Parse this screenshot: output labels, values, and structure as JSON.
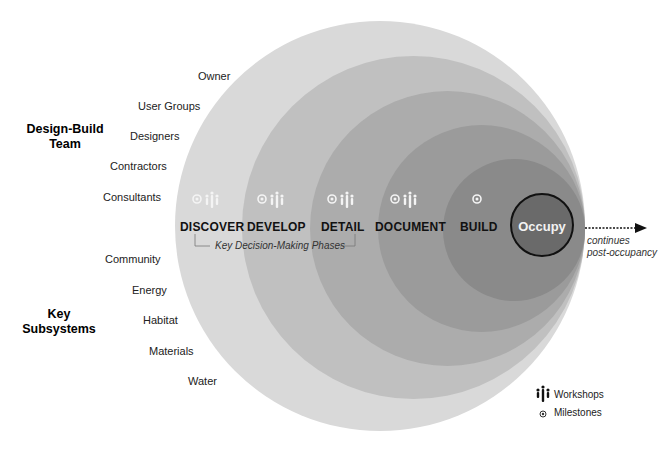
{
  "colors": {
    "ring1": "#d9d9d9",
    "ring2": "#c0c0c0",
    "ring3": "#acacac",
    "ring4": "#9b9b9b",
    "ring5": "#8a8a8a",
    "occupy_fill": "#6a6a6a",
    "occupy_stroke": "#111111",
    "icon_white": "#f4f4f4",
    "text": "#222222"
  },
  "design_build_team": {
    "heading_line1": "Design-Build",
    "heading_line2": "Team",
    "members": [
      "Owner",
      "User Groups",
      "Designers",
      "Contractors",
      "Consultants"
    ]
  },
  "key_subsystems": {
    "heading_line1": "Key",
    "heading_line2": "Subsystems",
    "items": [
      "Community",
      "Energy",
      "Habitat",
      "Materials",
      "Water"
    ]
  },
  "phases": [
    {
      "label": "DISCOVER",
      "milestone": true,
      "workshop": true
    },
    {
      "label": "DEVELOP",
      "milestone": true,
      "workshop": true
    },
    {
      "label": "DETAIL",
      "milestone": true,
      "workshop": true
    },
    {
      "label": "DOCUMENT",
      "milestone": true,
      "workshop": true
    },
    {
      "label": "BUILD",
      "milestone": true,
      "workshop": false
    }
  ],
  "occupy": {
    "label": "Occupy"
  },
  "decision_bracket": {
    "label": "Key Decision-Making Phases"
  },
  "continuation": {
    "line1": "continues",
    "line2": "post-occupancy"
  },
  "legend": {
    "workshops": {
      "icon": "people-group-icon",
      "label": "Workshops"
    },
    "milestones": {
      "icon": "target-dot-icon",
      "label": "Milestones"
    }
  }
}
